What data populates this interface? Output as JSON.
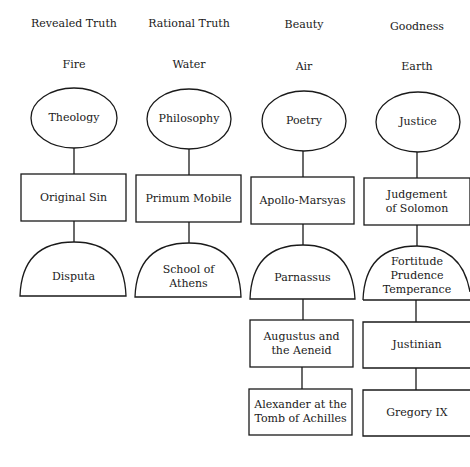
{
  "columns": [
    {
      "virtue": "Revealed Truth",
      "element": "Fire",
      "faculty": "Theology",
      "box1": "Original Sin",
      "arch": "Disputa"
    },
    {
      "virtue": "Rational Truth",
      "element": "Water",
      "faculty": "Philosophy",
      "box1": "Primum Mobile",
      "arch": "School of\nAthens"
    },
    {
      "virtue": "Beauty",
      "element": "Air",
      "faculty": "Poetry",
      "box1": "Apollo-Marsyas",
      "arch": "Parnassus",
      "box2": "Augustus and\nthe Aeneid",
      "box3": "Alexander at the\nTomb of Achilles"
    },
    {
      "virtue": "Goodness",
      "element": "Earth",
      "faculty": "Justice",
      "box1": "Judgement\nof Solomon",
      "arch": "Fortitude\nPrudence\nTemperance",
      "box2": "Justinian",
      "box3": "Gregory IX"
    }
  ],
  "colors": {
    "stroke": "#1a1a1a",
    "background": "#ffffff"
  }
}
